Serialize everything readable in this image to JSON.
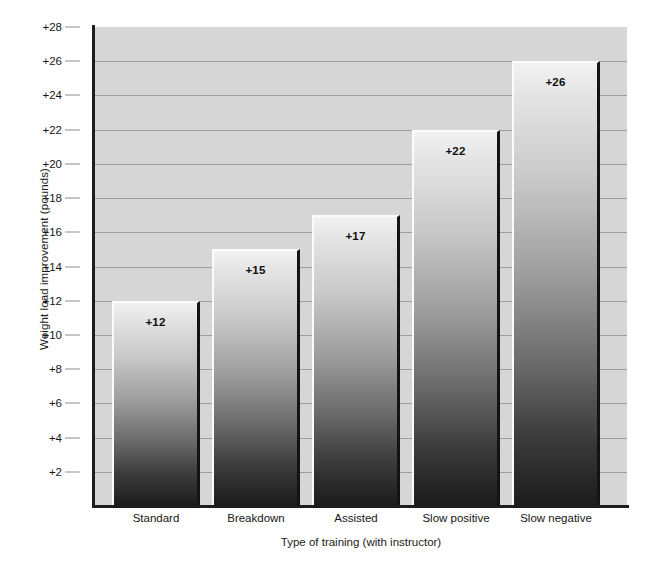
{
  "chart_data": {
    "type": "bar",
    "title": "",
    "xlabel": "Type of training (with instructor)",
    "ylabel": "Weight load improvement (pounds)",
    "categories": [
      "Standard",
      "Breakdown",
      "Assisted",
      "Slow positive",
      "Slow negative"
    ],
    "values": [
      12,
      15,
      17,
      22,
      26
    ],
    "data_labels": [
      "+12",
      "+15",
      "+17",
      "+22",
      "+26"
    ],
    "ylim": [
      0,
      28
    ],
    "ytick_values": [
      2,
      4,
      6,
      8,
      10,
      12,
      14,
      16,
      18,
      20,
      22,
      24,
      26,
      28
    ],
    "ytick_labels": [
      "+2",
      "+4",
      "+6",
      "+8",
      "+10",
      "+12",
      "+14",
      "+16",
      "+18",
      "+20",
      "+22",
      "+24",
      "+26",
      "+28"
    ],
    "grid": true,
    "legend": false,
    "colors": {
      "plot_background": "#d6d6d6",
      "gridline": "#9d9d9d",
      "axis": "#1d1d1d",
      "bar_top": "#f2f2f2",
      "bar_bottom": "#1b1b1b",
      "bar_highlight": "#fbfbfb",
      "bar_shadow": "#141414",
      "text": "#161616",
      "page_background": "#ffffff"
    }
  }
}
